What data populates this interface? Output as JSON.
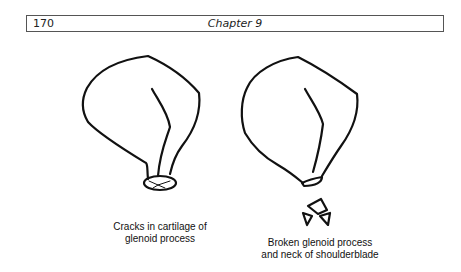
{
  "header": {
    "page_number": "170",
    "chapter_title": "Chapter 9"
  },
  "figures": [
    {
      "name": "cracked-glenoid",
      "caption_line1": "Cracks in cartilage of",
      "caption_line2": "glenoid process"
    },
    {
      "name": "broken-glenoid",
      "caption_line1": "Broken glenoid process",
      "caption_line2": "and neck of shoulderblade"
    }
  ]
}
